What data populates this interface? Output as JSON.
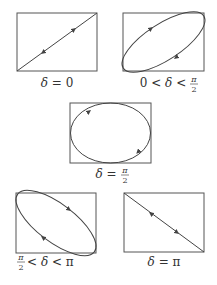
{
  "stroke_color": "#444444",
  "panels": [
    {
      "id": "delta-0",
      "label_parts": [
        "δ",
        " = 0"
      ],
      "label": "δ = 0",
      "shape": "line-ascending"
    },
    {
      "id": "delta-0-to-pi2",
      "label": "0 < δ < π/2",
      "label_prefix": "0 < ",
      "label_delta": "δ",
      "label_mid": " < ",
      "frac_num": "π",
      "frac_den": "2",
      "shape": "ellipse-ascending"
    },
    {
      "id": "delta-pi2",
      "label_delta": "δ",
      "label_mid": " = ",
      "frac_num": "π",
      "frac_den": "2",
      "label": "δ = π/2",
      "shape": "ellipse-upright"
    },
    {
      "id": "delta-pi2-to-pi",
      "label": "π/2 < δ < π",
      "frac_num": "π",
      "frac_den": "2",
      "label_mid": " < ",
      "label_delta": "δ",
      "label_suffix": " < π",
      "shape": "ellipse-descending"
    },
    {
      "id": "delta-pi",
      "label_parts": [
        "δ",
        " = π"
      ],
      "label": "δ = π",
      "shape": "line-descending"
    }
  ]
}
